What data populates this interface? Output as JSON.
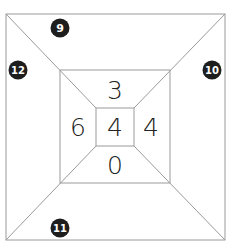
{
  "diagram": {
    "type": "nested-squares-puzzle",
    "colors": {
      "line": "#9a9a9a",
      "badge_fill": "#1e1e1e",
      "badge_text": "#ffffff",
      "number": "#222222",
      "background": "#ffffff"
    },
    "center_value": "4",
    "middle_ring": {
      "top": "3",
      "left": "6",
      "right": "4",
      "bottom": "0"
    },
    "outer_ring_badges": {
      "top": "9",
      "left": "12",
      "right": "10",
      "bottom": "11"
    }
  }
}
